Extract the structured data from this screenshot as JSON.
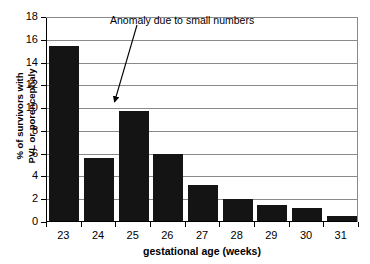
{
  "chart_data": {
    "type": "bar",
    "title": "",
    "xlabel": "gestational age (weeks)",
    "ylabel": "% of survivors with PVL or porencephaly",
    "ylabel_lines": [
      "% of survivors with",
      "PVL or porencephaly"
    ],
    "categories": [
      "23",
      "24",
      "25",
      "26",
      "27",
      "28",
      "29",
      "30",
      "31"
    ],
    "values": [
      15.4,
      5.5,
      9.7,
      5.9,
      3.2,
      1.9,
      1.45,
      1.15,
      0.4
    ],
    "ylim": [
      0,
      18
    ],
    "ytick_values": [
      0,
      2,
      4,
      6,
      8,
      10,
      12,
      14,
      16,
      18
    ],
    "ytick_labels": [
      "0",
      "2",
      "4",
      "6",
      "8",
      "10",
      "12",
      "14",
      "16",
      "18"
    ],
    "grid": true,
    "grid_axis": "y",
    "legend": false,
    "bar_color": "#141414",
    "grid_color": "#8a8a8a",
    "axis_color": "#000000",
    "annotations": [
      {
        "text": "Anomaly due to small numbers",
        "kind": "arrow-callout",
        "points_to_category": "25",
        "points_to_value": 10.2
      }
    ]
  }
}
